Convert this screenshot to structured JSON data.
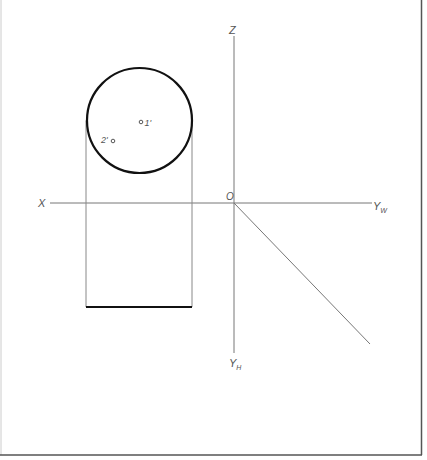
{
  "diagram": {
    "type": "orthographic-projection",
    "colors": {
      "background": "#ffffff",
      "axis": "#777777",
      "outline_thick": "#111111",
      "outline_thin": "#888888",
      "frame": "#555555",
      "label": "#555555"
    },
    "axes": {
      "z_label": "Z",
      "x_label": "X",
      "origin_label": "O",
      "yw_label": "Y",
      "yw_sub": "W",
      "yh_label": "Y",
      "yh_sub": "H"
    },
    "points": [
      {
        "id": "1",
        "label": "1'",
        "x": 141,
        "y": 122
      },
      {
        "id": "2",
        "label": "2'",
        "x": 113,
        "y": 141
      }
    ],
    "circle": {
      "cx": 139.5,
      "cy": 120.5,
      "r": 52.5
    },
    "rectangle": {
      "x1": 86,
      "x2": 192,
      "y_top": 120.5,
      "y_bottom": 307
    },
    "diagonal": {
      "x1": 234,
      "y1": 203,
      "x2": 370,
      "y2": 344
    }
  }
}
